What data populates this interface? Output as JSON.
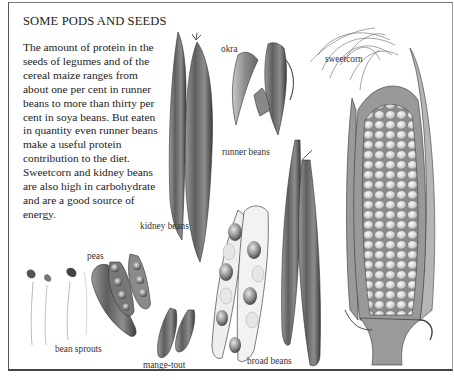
{
  "page": {
    "title": "SOME PODS AND SEEDS",
    "body_lines": [
      "The amount of protein in the",
      "seeds of legumes and of the",
      "cereal maize ranges from",
      "about one per cent in runner",
      "beans to more than thirty per",
      "cent in soya beans. But eaten",
      "in quantity even runner beans",
      "make a useful protein",
      "contribution to the diet.",
      "Sweetcorn and kidney beans",
      "are also high in carbohydrate",
      "and are a good source of",
      "energy."
    ]
  },
  "labels": {
    "okra": "okra",
    "sweetcorn": "sweetcorn",
    "runner_beans": "runner beans",
    "kidney_beans": "kidney beans",
    "peas": "peas",
    "bean_sprouts": "bean sprouts",
    "mange_tout": "mange-tout",
    "broad_beans": "broad beans"
  },
  "colors": {
    "ink": "#2a2a2a",
    "background": "#ffffff",
    "frame": "#555555"
  }
}
